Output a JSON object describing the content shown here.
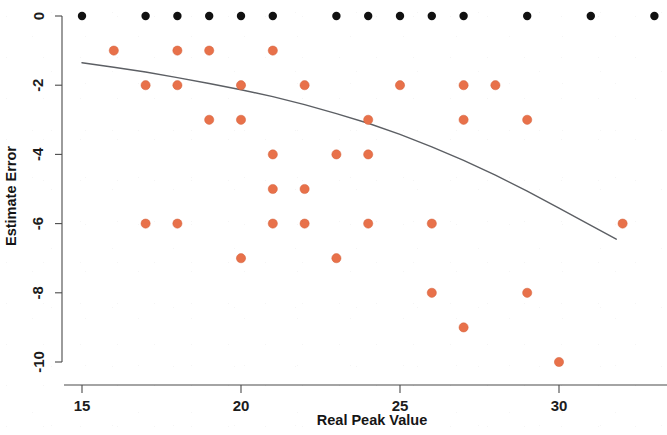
{
  "chart_data": {
    "type": "scatter",
    "title": "",
    "xlabel": "Real Peak Value",
    "ylabel": "Estimate Error",
    "xlim": [
      14.2,
      33.8
    ],
    "ylim": [
      -10.6,
      0.45
    ],
    "xticks": [
      15,
      20,
      25,
      30
    ],
    "xtick_labels": [
      "15",
      "20",
      "25",
      "30"
    ],
    "yticks": [
      0,
      -2,
      -4,
      -6,
      -8,
      -10
    ],
    "ytick_labels": [
      "0",
      "-2",
      "-4",
      "-6",
      "-8",
      "-10"
    ],
    "grid": false,
    "legend": null,
    "series": [
      {
        "name": "zero-error-points",
        "marker": "filled-circle",
        "color": "#111111",
        "radius": 4.2,
        "points": [
          {
            "x": 15.0,
            "y": 0
          },
          {
            "x": 17.0,
            "y": 0
          },
          {
            "x": 18.0,
            "y": 0
          },
          {
            "x": 19.0,
            "y": 0
          },
          {
            "x": 20.0,
            "y": 0
          },
          {
            "x": 21.0,
            "y": 0
          },
          {
            "x": 23.0,
            "y": 0
          },
          {
            "x": 24.0,
            "y": 0
          },
          {
            "x": 25.0,
            "y": 0
          },
          {
            "x": 26.0,
            "y": 0
          },
          {
            "x": 27.0,
            "y": 0
          },
          {
            "x": 29.0,
            "y": 0
          },
          {
            "x": 31.0,
            "y": 0
          },
          {
            "x": 33.0,
            "y": 0
          }
        ]
      },
      {
        "name": "error-points",
        "marker": "filled-circle",
        "color": "#e8714a",
        "radius": 4.6,
        "points": [
          {
            "x": 16.0,
            "y": -1
          },
          {
            "x": 18.0,
            "y": -1
          },
          {
            "x": 19.0,
            "y": -1
          },
          {
            "x": 21.0,
            "y": -1
          },
          {
            "x": 17.0,
            "y": -2
          },
          {
            "x": 18.0,
            "y": -2
          },
          {
            "x": 20.0,
            "y": -2
          },
          {
            "x": 22.0,
            "y": -2
          },
          {
            "x": 25.0,
            "y": -2
          },
          {
            "x": 27.0,
            "y": -2
          },
          {
            "x": 28.0,
            "y": -2
          },
          {
            "x": 19.0,
            "y": -3
          },
          {
            "x": 20.0,
            "y": -3
          },
          {
            "x": 24.0,
            "y": -3
          },
          {
            "x": 27.0,
            "y": -3
          },
          {
            "x": 29.0,
            "y": -3
          },
          {
            "x": 21.0,
            "y": -4
          },
          {
            "x": 23.0,
            "y": -4
          },
          {
            "x": 24.0,
            "y": -4
          },
          {
            "x": 21.0,
            "y": -5
          },
          {
            "x": 22.0,
            "y": -5
          },
          {
            "x": 17.0,
            "y": -6
          },
          {
            "x": 18.0,
            "y": -6
          },
          {
            "x": 21.0,
            "y": -6
          },
          {
            "x": 22.0,
            "y": -6
          },
          {
            "x": 24.0,
            "y": -6
          },
          {
            "x": 26.0,
            "y": -6
          },
          {
            "x": 32.0,
            "y": -6
          },
          {
            "x": 20.0,
            "y": -7
          },
          {
            "x": 23.0,
            "y": -7
          },
          {
            "x": 26.0,
            "y": -8
          },
          {
            "x": 29.0,
            "y": -8
          },
          {
            "x": 27.0,
            "y": -9
          },
          {
            "x": 30.0,
            "y": -10
          }
        ]
      }
    ],
    "trend_curve": {
      "name": "fitted-trend",
      "color": "#5c5f64",
      "style": "solid",
      "points": [
        {
          "x": 15.0,
          "y": -1.35
        },
        {
          "x": 16.0,
          "y": -1.48
        },
        {
          "x": 17.0,
          "y": -1.62
        },
        {
          "x": 18.0,
          "y": -1.78
        },
        {
          "x": 19.0,
          "y": -1.95
        },
        {
          "x": 20.0,
          "y": -2.13
        },
        {
          "x": 21.0,
          "y": -2.33
        },
        {
          "x": 22.0,
          "y": -2.56
        },
        {
          "x": 23.0,
          "y": -2.82
        },
        {
          "x": 24.0,
          "y": -3.1
        },
        {
          "x": 25.0,
          "y": -3.42
        },
        {
          "x": 26.0,
          "y": -3.78
        },
        {
          "x": 27.0,
          "y": -4.17
        },
        {
          "x": 28.0,
          "y": -4.6
        },
        {
          "x": 29.0,
          "y": -5.06
        },
        {
          "x": 30.0,
          "y": -5.55
        },
        {
          "x": 31.0,
          "y": -6.05
        },
        {
          "x": 31.8,
          "y": -6.45
        }
      ]
    }
  },
  "axes": {
    "x_axis_label": "Real Peak Value",
    "y_axis_label": "Estimate Error"
  },
  "colors": {
    "point_zero": "#111111",
    "point_error": "#e8714a",
    "trend": "#5c5f64",
    "axis": "#4a4a4a",
    "background": "#ffffff"
  }
}
